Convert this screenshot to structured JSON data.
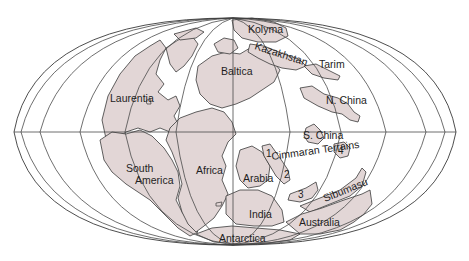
{
  "map": {
    "projection": "elliptical (Mollweide-style) world map",
    "colors": {
      "land": "#e2d6d6",
      "ocean": "#ffffff",
      "lines": "#3a3a3a"
    },
    "labels": {
      "kolyma": "Kolyma",
      "kazakhstan": "Kazakhstan",
      "tarim": "Tarim",
      "baltica": "Baltica",
      "laurentia": "Laurentia",
      "n_china": "N. China",
      "s_china": "S. China",
      "south_america_1": "South",
      "south_america_2": "America",
      "africa": "Africa",
      "arabia": "Arabia",
      "cimmeran_terrains": "Cimmaran Terrains",
      "sibumasu": "Sibumasu",
      "india": "India",
      "australia": "Australia",
      "antarctica": "Antarctica"
    },
    "terrain_numbers": [
      "1",
      "2",
      "3",
      "4"
    ]
  }
}
